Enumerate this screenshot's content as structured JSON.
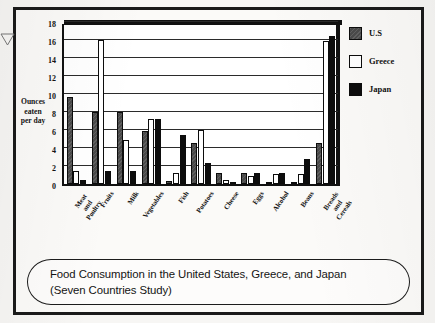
{
  "figure": {
    "caption_line1": "Food Consumption in the United States, Greece, and Japan",
    "caption_line2": "(Seven Countries Study)"
  },
  "legend": {
    "items": [
      {
        "label": "U.S",
        "key": "us",
        "color": "#4a4a4a"
      },
      {
        "label": "Greece",
        "key": "greece",
        "color": "#ffffff"
      },
      {
        "label": "Japan",
        "key": "japan",
        "color": "#0d0d0d"
      }
    ]
  },
  "axis": {
    "y_title_line1": "Ounces",
    "y_title_line2": "eaten",
    "y_title_line3": "per day",
    "y_ticks": [
      "0",
      "2",
      "4",
      "6",
      "8",
      "10",
      "12",
      "14",
      "16",
      "18"
    ]
  },
  "chart_data": {
    "type": "bar",
    "title": "Food Consumption in the United States, Greece, and Japan (Seven Countries Study)",
    "xlabel": "",
    "ylabel": "Ounces eaten per day",
    "ylim": [
      0,
      18
    ],
    "ytick_interval": 2,
    "grid": true,
    "legend_position": "right",
    "categories": [
      "Meat and Poultry",
      "Fruits",
      "Milk",
      "Vegetables",
      "Fish",
      "Potatoes",
      "Cheese",
      "Eggs",
      "Alcohol",
      "Beans",
      "Breads and Cereals"
    ],
    "category_lines": [
      [
        "Meat",
        "and",
        "Poultry"
      ],
      [
        "Fruits"
      ],
      [
        "Milk"
      ],
      [
        "Vegetables"
      ],
      [
        "Fish"
      ],
      [
        "Potatoes"
      ],
      [
        "Cheese"
      ],
      [
        "Eggs"
      ],
      [
        "Alcohol"
      ],
      [
        "Beans"
      ],
      [
        "Breads",
        "and",
        "Cereals"
      ]
    ],
    "series": [
      {
        "name": "U.S",
        "key": "us",
        "values": [
          9.7,
          8.0,
          8.0,
          5.9,
          0.3,
          4.6,
          1.25,
          1.25,
          0.15,
          0.15,
          4.6
        ]
      },
      {
        "name": "Greece",
        "key": "greece",
        "values": [
          1.4,
          16.0,
          4.9,
          7.2,
          1.25,
          6.0,
          0.45,
          0.9,
          1.15,
          1.1,
          15.9
        ]
      },
      {
        "name": "Japan",
        "key": "japan",
        "values": [
          0.5,
          1.5,
          1.5,
          7.2,
          5.5,
          2.3,
          0.05,
          1.25,
          1.25,
          2.8,
          16.4
        ]
      }
    ]
  }
}
